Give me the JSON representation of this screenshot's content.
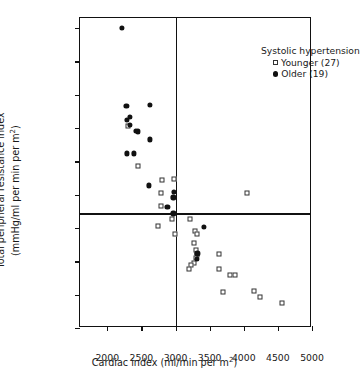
{
  "chart_data": {
    "type": "scatter",
    "title": "",
    "xlabel": "Cardiac index (ml/min per m2)",
    "ylabel": "Total peripheral resistance index (mmHg/ml per min per m2)",
    "ylabel_line1": "Total peripheral resistance index",
    "ylabel_line2": "(mmHg/ml per min per m",
    "xlabel_prefix": "Cardiac index (ml/min per m",
    "superscript": "2",
    "xlabel_suffix": ")",
    "xlim": [
      1600,
      5000
    ],
    "ylim": [
      0.02,
      0.0665
    ],
    "grid": false,
    "legend_position": "top-right",
    "legend_title": "Systolic hypertension",
    "xticks": [
      2000,
      2500,
      3000,
      3500,
      4000,
      4500,
      5000
    ],
    "xticklabels": [
      "2000",
      "2500",
      "3000",
      "3500",
      "4000",
      "4500",
      "5000"
    ],
    "yticks": [
      0.02,
      0.025,
      0.03,
      0.035,
      0.04,
      0.045,
      0.05,
      0.055,
      0.06,
      0.065
    ],
    "yticklabels": [
      "0.020",
      "0.025",
      "0.030",
      "0.035",
      "0.040",
      "0.045",
      "0.050",
      "0.055",
      "0.060",
      "0.065"
    ],
    "reference_lines": {
      "vertical_x": 3000,
      "horizontal_y": 0.0372
    },
    "series": [
      {
        "name": "Younger (27)",
        "label": "Younger",
        "count": 27,
        "marker": "open-square",
        "color": "#ffffff",
        "edge_color": "#333333",
        "points": [
          [
            2300,
            0.0503
          ],
          [
            2455,
            0.0443
          ],
          [
            2800,
            0.0422
          ],
          [
            2975,
            0.0423
          ],
          [
            2790,
            0.0403
          ],
          [
            2780,
            0.0383
          ],
          [
            2955,
            0.0364
          ],
          [
            2740,
            0.0353
          ],
          [
            2995,
            0.0341
          ],
          [
            3215,
            0.0363
          ],
          [
            3290,
            0.0345
          ],
          [
            3320,
            0.0341
          ],
          [
            3270,
            0.0327
          ],
          [
            3300,
            0.0317
          ],
          [
            3310,
            0.031
          ],
          [
            3300,
            0.0305
          ],
          [
            3270,
            0.0297
          ],
          [
            3225,
            0.0294
          ],
          [
            3195,
            0.0288
          ],
          [
            3640,
            0.0311
          ],
          [
            3640,
            0.0289
          ],
          [
            3800,
            0.0279
          ],
          [
            3865,
            0.0279
          ],
          [
            3690,
            0.0254
          ],
          [
            4050,
            0.0402
          ],
          [
            4145,
            0.0255
          ],
          [
            4240,
            0.0246
          ],
          [
            4560,
            0.0238
          ]
        ]
      },
      {
        "name": "Older (19)",
        "label": "Older",
        "count": 19,
        "marker": "filled-circle",
        "color": "#111111",
        "points": [
          [
            2210,
            0.065
          ],
          [
            2280,
            0.0533
          ],
          [
            2620,
            0.0535
          ],
          [
            2335,
            0.0517
          ],
          [
            2285,
            0.0512
          ],
          [
            2330,
            0.0505
          ],
          [
            2420,
            0.0496
          ],
          [
            2450,
            0.0495
          ],
          [
            2620,
            0.0483
          ],
          [
            2285,
            0.0462
          ],
          [
            2390,
            0.0462
          ],
          [
            2605,
            0.0414
          ],
          [
            2975,
            0.0404
          ],
          [
            2970,
            0.0396
          ],
          [
            2880,
            0.0382
          ],
          [
            2970,
            0.0372
          ],
          [
            3420,
            0.0352
          ],
          [
            3320,
            0.0312
          ],
          [
            3310,
            0.0304
          ]
        ]
      }
    ]
  }
}
